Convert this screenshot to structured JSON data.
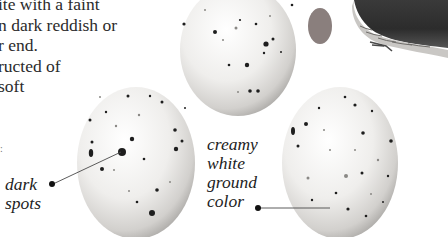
{
  "body_text": {
    "lines": [
      "ite with a faint",
      "n dark reddish or",
      "r end.",
      "ructed of",
      "soft"
    ]
  },
  "edge_fragment": ":",
  "labels": {
    "dark_spots": {
      "lines": [
        "dark",
        "spots"
      ]
    },
    "ground_color": {
      "lines": [
        "creamy",
        "white",
        "ground",
        "color"
      ]
    }
  },
  "illustrations": {
    "eggs": [
      {
        "name": "egg-top",
        "description": "speckled egg, upper"
      },
      {
        "name": "egg-left",
        "description": "speckled egg with dark spots"
      },
      {
        "name": "egg-right",
        "description": "speckled egg with creamy white ground color"
      }
    ],
    "oval_swatch": {
      "description": "actual-size egg silhouette",
      "color": "#8a7f7d"
    },
    "bird": {
      "description": "bird illustration, partially cropped"
    }
  },
  "colors": {
    "background": "#ffffff",
    "text": "#2b2b2b",
    "egg_light": "#f4f3f1",
    "egg_shadow": "#b9b7b4",
    "spot": "#1e1e1e"
  }
}
